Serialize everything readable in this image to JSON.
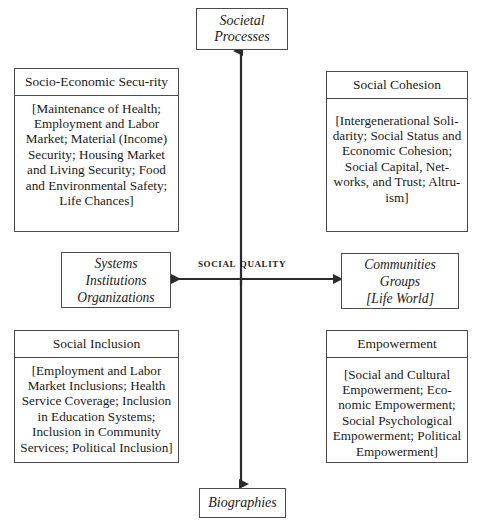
{
  "diagram": {
    "center_label": "Social Quality",
    "poles": {
      "top": "Societal Processes",
      "bottom": "Biographies"
    },
    "axis_ends": {
      "left": {
        "line1": "Systems",
        "line2": "Institutions",
        "line3": "Organizations"
      },
      "right": {
        "line1": "Communities",
        "line2": "Groups",
        "line3": "[Life World]"
      }
    },
    "quadrants": {
      "top_left": {
        "title": "Socio-Economic Secu-­rity",
        "items": "[Maintenance of Health; Employment and Labor Market; Material (In­come) Security; Hous­ing Market and Living Security; Food and Environmental Safety; Life Chances]"
      },
      "top_right": {
        "title": "Social Cohesion",
        "items": "[Intergenerational Soli­darity; Social Status and Economic Cohesion; Social Capital, Net­works, and Trust; Altru­ism]"
      },
      "bottom_left": {
        "title": "Social Inclusion",
        "items": "[Employment and Labor Market Inclusions; Health Service Cover­age; Inclusion in Educa­tion Systems; Inclusion in Community Services; Political Inclusion]"
      },
      "bottom_right": {
        "title": "Empowerment",
        "items": "[Social and Cultural Empowerment; Eco­nomic Empowerment; Social Psychological Empowerment; Political Empowerment]"
      }
    },
    "colors": {
      "line": "#4a4a4a",
      "text": "#1a1a1a",
      "background": "#ffffff"
    }
  }
}
